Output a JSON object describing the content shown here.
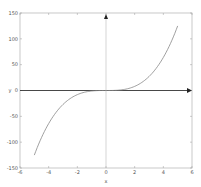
{
  "chart_data": {
    "type": "line",
    "title": "",
    "xlabel": "x",
    "ylabel": "y",
    "xlim": [
      -6,
      6
    ],
    "ylim": [
      -150,
      150
    ],
    "x_ticks": [
      -6,
      -4,
      -2,
      0,
      2,
      4,
      6
    ],
    "y_ticks": [
      150,
      100,
      50,
      0,
      -50,
      -100,
      -150
    ],
    "grid": false,
    "legend": null,
    "series": [
      {
        "name": "y = x^3",
        "x": [
          -5,
          -4.5,
          -4,
          -3.5,
          -3,
          -2.5,
          -2,
          -1.5,
          -1,
          -0.5,
          0,
          0.5,
          1,
          1.5,
          2,
          2.5,
          3,
          3.5,
          4,
          4.5,
          5
        ],
        "values": [
          -125,
          -91.1,
          -64,
          -42.9,
          -27,
          -15.6,
          -8,
          -3.4,
          -1,
          -0.1,
          0,
          0.1,
          1,
          3.4,
          8,
          15.6,
          27,
          42.9,
          64,
          91.1,
          125
        ]
      }
    ],
    "annotations": [
      "arrow on x-axis at x=6",
      "arrow on y-axis at y=150"
    ],
    "colors": {
      "curve": "#888888",
      "axes": "#333333",
      "frame": "#aaaaaa"
    }
  }
}
